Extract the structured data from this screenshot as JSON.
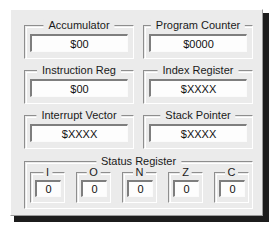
{
  "panel": {
    "title": "CPU Register Panel",
    "background_color": "#ebebeb",
    "shadow_color": "#1c1c1c"
  },
  "registers": [
    {
      "label": "Accumulator",
      "value": "$00",
      "name": "accumulator"
    },
    {
      "label": "Program Counter",
      "value": "$0000",
      "name": "program-counter"
    },
    {
      "label": "Instruction Reg",
      "value": "$00",
      "name": "instruction-reg"
    },
    {
      "label": "Index Register",
      "value": "$XXXX",
      "name": "index-register"
    },
    {
      "label": "Interrupt Vector",
      "value": "$XXXX",
      "name": "interrupt-vector"
    },
    {
      "label": "Stack Pointer",
      "value": "$XXXX",
      "name": "stack-pointer"
    }
  ],
  "status_register": {
    "label": "Status Register",
    "flags": [
      {
        "label": "I",
        "value": "0",
        "name": "flag-i"
      },
      {
        "label": "O",
        "value": "0",
        "name": "flag-o"
      },
      {
        "label": "N",
        "value": "0",
        "name": "flag-n"
      },
      {
        "label": "Z",
        "value": "0",
        "name": "flag-z"
      },
      {
        "label": "C",
        "value": "0",
        "name": "flag-c"
      }
    ]
  }
}
